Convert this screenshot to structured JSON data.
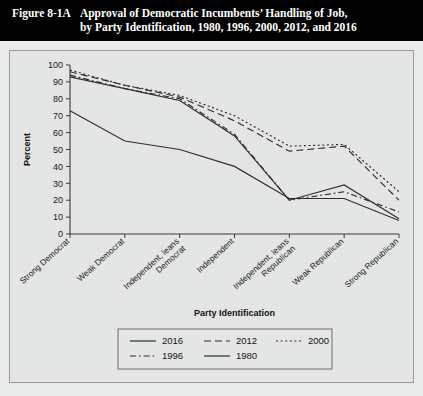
{
  "header": {
    "figure_label": "Figure 8-1A",
    "title_line1": "Approval of Democratic Incumbents’ Handling of Job,",
    "title_line2": "by Party Identification, 1980, 1996, 2000, 2012, and 2016"
  },
  "chart_data": {
    "type": "line",
    "title": "",
    "xlabel": "Party Identification",
    "ylabel": "Percent",
    "ylim": [
      0,
      100
    ],
    "ytick_step": 10,
    "yticks": [
      0,
      10,
      20,
      30,
      40,
      50,
      60,
      70,
      80,
      90,
      100
    ],
    "grid": false,
    "legend_position": "bottom",
    "categories": [
      "Strong Democrat",
      "Weak Democrat",
      "Independent, leans Democrat",
      "Independent",
      "Independent, leans Republican",
      "Weak Republican",
      "Strong Republican"
    ],
    "category_labels_wrapped": [
      [
        "Strong Democrat"
      ],
      [
        "Weak Democrat"
      ],
      [
        "Independent, leans",
        "Democrat"
      ],
      [
        "Independent"
      ],
      [
        "Independent, leans",
        "Republican"
      ],
      [
        "Weak Republican"
      ],
      [
        "Strong Republican"
      ]
    ],
    "series": [
      {
        "name": "2016",
        "dash": "none",
        "values": [
          93,
          86,
          79,
          58,
          20,
          29,
          9
        ]
      },
      {
        "name": "2012",
        "dash": "dashed",
        "values": [
          96,
          88,
          81,
          67,
          49,
          52,
          20
        ]
      },
      {
        "name": "2000",
        "dash": "dotted",
        "values": [
          97,
          88,
          82,
          70,
          52,
          53,
          25
        ]
      },
      {
        "name": "1996",
        "dash": "dashdot",
        "values": [
          94,
          86,
          80,
          59,
          20,
          25,
          13
        ]
      },
      {
        "name": "1980",
        "dash": "none",
        "values": [
          73,
          55,
          50,
          40,
          21,
          21,
          8
        ]
      }
    ]
  }
}
